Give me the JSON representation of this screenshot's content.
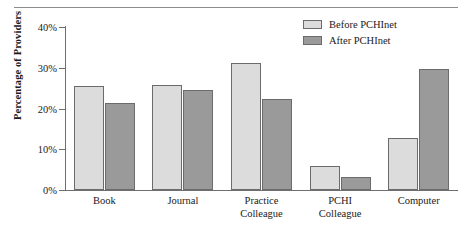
{
  "chart_data": {
    "type": "bar",
    "title": "",
    "xlabel": "",
    "ylabel": "Percentage of Providers",
    "categories": [
      "Book",
      "Journal",
      "Practice Colleague",
      "PCHI Colleague",
      "Computer"
    ],
    "category_lines": [
      [
        "Book"
      ],
      [
        "Journal"
      ],
      [
        "Practice",
        "Colleague"
      ],
      [
        "PCHI",
        "Colleague"
      ],
      [
        "Computer"
      ]
    ],
    "series": [
      {
        "name": "Before PCHInet",
        "color": "#dcdcdc",
        "values": [
          25.5,
          25.7,
          31.2,
          6.0,
          12.7
        ]
      },
      {
        "name": "After PCHInet",
        "color": "#9a9a9a",
        "values": [
          21.4,
          24.6,
          22.4,
          3.2,
          29.7
        ]
      }
    ],
    "ylim": [
      0,
      40
    ],
    "yticks": [
      0,
      10,
      20,
      30,
      40
    ],
    "ytick_labels": [
      "0%",
      "10%",
      "20%",
      "30%",
      "40%"
    ],
    "grid": false,
    "legend_position": "top-right"
  }
}
